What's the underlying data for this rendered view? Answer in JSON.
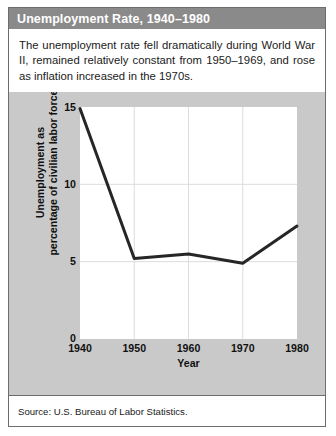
{
  "figure": {
    "title": "Unemployment Rate, 1940–1980",
    "caption": "The unemployment rate fell dramatically during World War II, remained relatively constant from 1950–1969, and rose as inflation increased in the 1970s.",
    "source": "Source: U.S. Bureau of Labor Statistics.",
    "colors": {
      "title_bar": "#8a8a8a",
      "title_text": "#ffffff",
      "panel_background": "#c9c9c9",
      "plot_background": "#ffffff",
      "line": "#262626",
      "gridline": "#d8d8d8",
      "border": "#6d6d6d"
    }
  },
  "chart_data": {
    "type": "line",
    "title": "Unemployment Rate, 1940–1980",
    "xlabel": "Year",
    "ylabel": "Unemployment as percentage of civilian labor force",
    "ylabel_line1": "Unemployment as",
    "ylabel_line2": "percentage of civilian labor force",
    "x": [
      1940,
      1950,
      1960,
      1970,
      1980
    ],
    "values": [
      14.9,
      5.2,
      5.5,
      4.9,
      7.3
    ],
    "xtick_labels": [
      "1940",
      "1950",
      "1960",
      "1970",
      "1980"
    ],
    "ytick_labels": [
      "0",
      "5",
      "10",
      "15"
    ],
    "yticks": [
      0,
      5,
      10,
      15
    ],
    "xlim": [
      1940,
      1980
    ],
    "ylim": [
      0,
      15
    ],
    "grid": true,
    "legend": "none",
    "series": [
      {
        "name": "Unemployment rate",
        "values": [
          14.9,
          5.2,
          5.5,
          4.9,
          7.3
        ]
      }
    ]
  }
}
